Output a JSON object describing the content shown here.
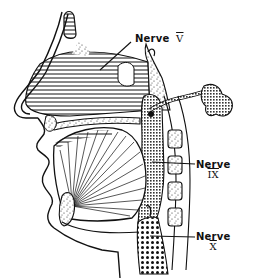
{
  "figure": {
    "labels": [
      {
        "id": "nerve-v",
        "word": "Nerve",
        "numeral": "V"
      },
      {
        "id": "nerve-ix",
        "word": "Nerve",
        "numeral": "IX"
      },
      {
        "id": "nerve-x",
        "word": "Nerve",
        "numeral": "X"
      }
    ],
    "colors": {
      "ink": "#111111",
      "background": "#ffffff"
    }
  }
}
